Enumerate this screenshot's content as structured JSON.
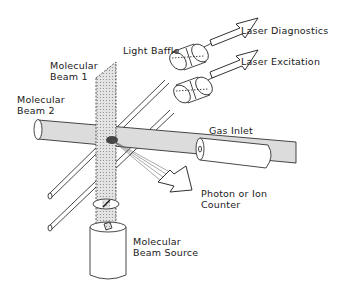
{
  "labels": {
    "light_baffle": "Light Baffle",
    "laser_diagnostics": "Laser Diagnostics",
    "laser_excitation": "Laser Excitation",
    "molecular_beam_1_line1": "Molecular",
    "molecular_beam_1_line2": "Beam 1",
    "molecular_beam_2_line1": "Molecular",
    "molecular_beam_2_line2": "Beam  2",
    "gas_inlet": "Gas Inlet",
    "counter_line1": "Photon  or  Ion",
    "counter_line2": "Counter",
    "source_line1": "Molecular",
    "source_line2": "Beam  Source"
  },
  "colors": {
    "ink": "#1a1a1a",
    "beam_fill": "#d9d9d9",
    "background": "#ffffff"
  }
}
